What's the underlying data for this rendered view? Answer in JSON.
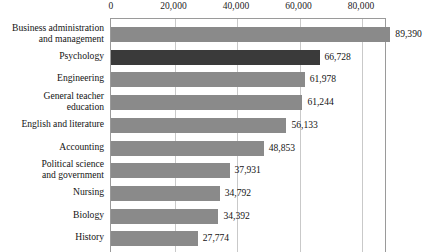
{
  "chart_data": {
    "type": "bar",
    "orientation": "horizontal",
    "title": "",
    "subtitle": "",
    "xlabel": "",
    "ylabel": "",
    "xlim": [
      0,
      88320
    ],
    "grid": true,
    "legend": null,
    "axis_position": "top",
    "tick_labels": [
      "0",
      "20,000",
      "40,000",
      "60,000",
      "80,000"
    ],
    "tick_values": [
      0,
      20000,
      40000,
      60000,
      80000
    ],
    "categories": [
      "Business administration\nand management",
      "Psychology",
      "Engineering",
      "General teacher\neducation",
      "English and literature",
      "Accounting",
      "Political science\nand government",
      "Nursing",
      "Biology",
      "History"
    ],
    "values": [
      89390,
      66728,
      61978,
      61244,
      56133,
      48853,
      37931,
      34792,
      34392,
      27774
    ],
    "value_labels": [
      "89,390",
      "66,728",
      "61,978",
      "61,244",
      "56,133",
      "48,853",
      "37,931",
      "34,792",
      "34,392",
      "27,774"
    ],
    "highlighted_index": 1,
    "colors": {
      "bar": "#8a8a8a",
      "bar_highlight": "#3a3a3a",
      "gridline": "#c9c9c9",
      "frame": "#9a9a9a",
      "text": "#141414",
      "background": "#ffffff"
    }
  }
}
